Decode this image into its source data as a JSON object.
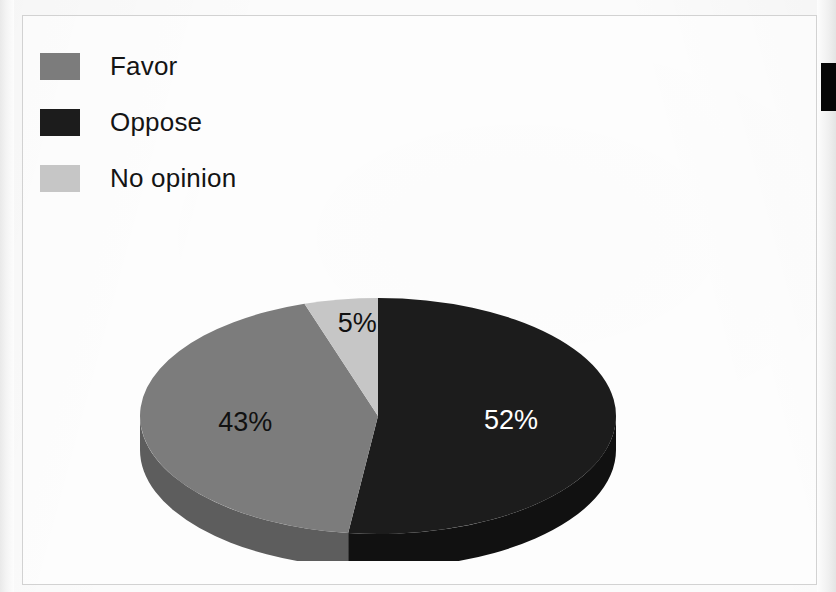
{
  "page": {
    "background_color": "#fbfbfb",
    "frame_border_color": "#d2d2d2"
  },
  "artifact": {
    "name": "black-edge-mark",
    "color": "#060606"
  },
  "legend": {
    "items": [
      {
        "label": "Favor",
        "color": "#7c7c7c",
        "side_color": "#5d5d5d"
      },
      {
        "label": "Oppose",
        "color": "#1c1c1c",
        "side_color": "#111111"
      },
      {
        "label": "No opinion",
        "color": "#c6c6c6",
        "side_color": "#a0a0a0"
      }
    ]
  },
  "chart_data": {
    "type": "pie",
    "title": "",
    "subtitle": "",
    "xlabel": "",
    "ylabel": "",
    "three_d": true,
    "start_angle_deg": 0,
    "direction": "clockwise",
    "legend_position": "top-left",
    "grid": false,
    "categories": [
      "Oppose",
      "Favor",
      "No opinion"
    ],
    "values": [
      52,
      43,
      5
    ],
    "value_unit": "%",
    "data_labels": [
      "52%",
      "43%",
      "5%"
    ],
    "slices": [
      {
        "name": "Oppose",
        "value": 52,
        "label": "52%",
        "color": "#1c1c1c",
        "side_color": "#111111",
        "label_color": "#ffffff"
      },
      {
        "name": "Favor",
        "value": 43,
        "label": "43%",
        "color": "#7c7c7c",
        "side_color": "#5d5d5d",
        "label_color": "#111111"
      },
      {
        "name": "No opinion",
        "value": 5,
        "label": "5%",
        "color": "#c6c6c6",
        "side_color": "#a0a0a0",
        "label_color": "#111111"
      }
    ]
  }
}
